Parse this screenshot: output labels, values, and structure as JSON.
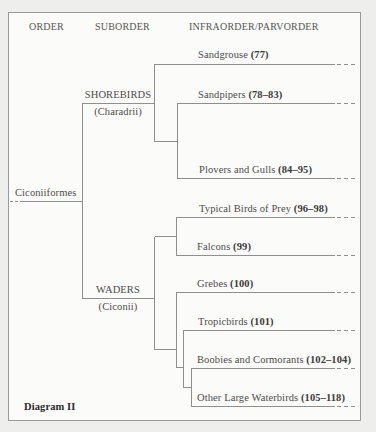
{
  "headers": {
    "order": "ORDER",
    "suborder": "SUBORDER",
    "infraorder": "INFRAORDER/PARVORDER"
  },
  "order": {
    "name": "Ciconiiformes"
  },
  "suborders": [
    {
      "name": "SHOREBIRDS",
      "latin": "(Charadrii)"
    },
    {
      "name": "WADERS",
      "latin": "(Ciconii)"
    }
  ],
  "taxa": [
    {
      "name": "Sandgrouse",
      "range": "(77)"
    },
    {
      "name": "Sandpipers",
      "range": "(78–83)"
    },
    {
      "name": "Plovers and Gulls",
      "range": "(84–95)"
    },
    {
      "name": "Typical Birds of Prey",
      "range": "(96–98)"
    },
    {
      "name": "Falcons",
      "range": "(99)"
    },
    {
      "name": "Grebes",
      "range": "(100)"
    },
    {
      "name": "Tropicbirds",
      "range": "(101)"
    },
    {
      "name": "Boobies and Cormorants",
      "range": "(102–104)"
    },
    {
      "name": "Other Large Waterbirds",
      "range": "(105–118)"
    }
  ],
  "caption": "Diagram II",
  "colors": {
    "line": "#8f8f8f",
    "paper": "#fbfbf9",
    "background": "#eeeeec"
  }
}
